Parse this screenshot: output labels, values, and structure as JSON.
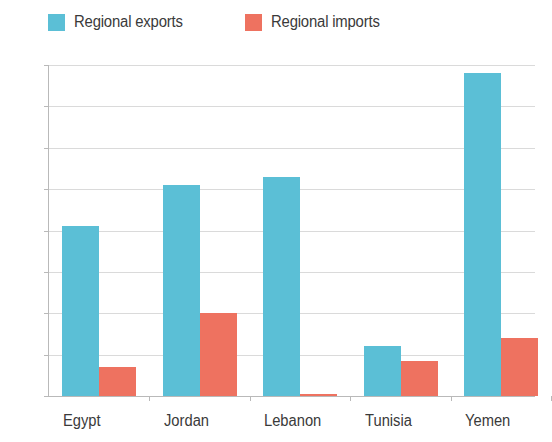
{
  "chart_data": {
    "type": "bar",
    "title": "",
    "xlabel": "",
    "ylabel": "",
    "ylim": [
      0,
      80
    ],
    "ytick_labels": [
      "0%",
      "10%",
      "20%",
      "30%",
      "40%",
      "50%",
      "60%",
      "70%",
      "80%"
    ],
    "ytick_values": [
      0,
      10,
      20,
      30,
      40,
      50,
      60,
      70,
      80
    ],
    "grid": true,
    "legend_position": "top-left",
    "categories": [
      "Egypt",
      "Jordan",
      "Lebanon",
      "Tunisia",
      "Yemen"
    ],
    "series": [
      {
        "name": "Regional exports",
        "color": "#5bbfd6",
        "values": [
          41,
          51,
          53,
          12,
          78
        ]
      },
      {
        "name": "Regional imports",
        "color": "#ee7260",
        "values": [
          7,
          20,
          0.5,
          8.5,
          14
        ]
      }
    ]
  },
  "colors": {
    "exports": "#5bbfd6",
    "imports": "#ee7260",
    "gridline": "#dadada",
    "axis": "#b9b9b9",
    "text": "#3a3a3a",
    "background": "#ffffff"
  }
}
